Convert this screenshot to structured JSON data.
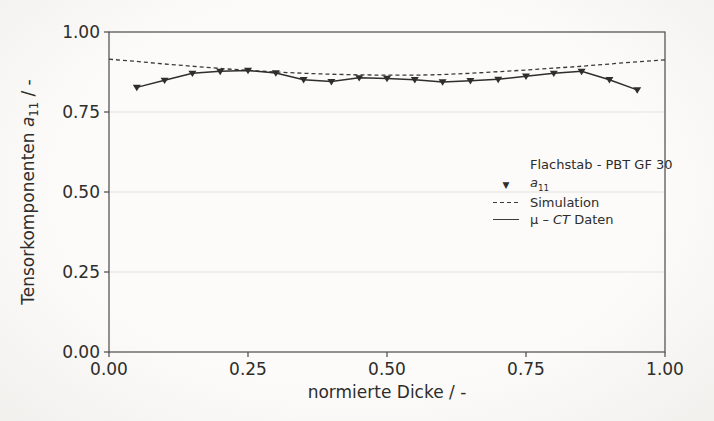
{
  "chart_data": {
    "type": "line",
    "title": "",
    "xlabel": "normierte Dicke / -",
    "ylabel": "Tensorkomponenten a11 / -",
    "ylabel_parts": {
      "prefix": "Tensorkomponenten ",
      "var": "a",
      "sub": "11",
      "suffix": " / -"
    },
    "xlim": [
      0,
      1
    ],
    "ylim": [
      0,
      1
    ],
    "x_ticks": [
      "0.00",
      "0.25",
      "0.50",
      "0.75",
      "1.00"
    ],
    "y_ticks": [
      "1.00",
      "0.75",
      "0.50",
      "0.25",
      "0.00"
    ],
    "grid": "faint horizontal gridlines at interior y ticks",
    "legend_position": "center right, no border",
    "colors": {
      "axis": "#4a4a48",
      "grid": "#eceae7",
      "line": "#2e2e2c",
      "text": "#2d2d2b",
      "background": "#faf9f7"
    },
    "legend": {
      "title": "Flachstab - PBT GF 30",
      "entries": [
        {
          "label": "a11",
          "label_var": "a",
          "label_sub": "11",
          "sample": "triangle-down-marker"
        },
        {
          "label": "Simulation",
          "sample": "dashed-line"
        },
        {
          "label": "μ – CT Daten",
          "label_prefix": "μ – ",
          "label_italic": "CT",
          "label_suffix": " Daten",
          "sample": "solid-line"
        }
      ]
    },
    "series": [
      {
        "name": "Simulation",
        "line": "dashed",
        "dash": "4 3",
        "width": 1.3,
        "color": "#3a3a38",
        "marker": "none",
        "x": [
          0.0,
          0.05,
          0.1,
          0.15,
          0.2,
          0.25,
          0.3,
          0.35,
          0.4,
          0.45,
          0.5,
          0.55,
          0.6,
          0.65,
          0.7,
          0.75,
          0.8,
          0.85,
          0.9,
          0.95,
          1.0
        ],
        "y": [
          0.915,
          0.908,
          0.9,
          0.893,
          0.886,
          0.88,
          0.875,
          0.871,
          0.868,
          0.866,
          0.865,
          0.865,
          0.867,
          0.871,
          0.876,
          0.881,
          0.887,
          0.893,
          0.9,
          0.907,
          0.913
        ]
      },
      {
        "name": "μ – CT Daten (a11)",
        "line": "solid",
        "width": 1.5,
        "color": "#2e2e2c",
        "marker": "triangle-down",
        "x": [
          0.05,
          0.1,
          0.15,
          0.2,
          0.25,
          0.3,
          0.35,
          0.4,
          0.45,
          0.5,
          0.55,
          0.6,
          0.65,
          0.7,
          0.75,
          0.8,
          0.85,
          0.9,
          0.95
        ],
        "y": [
          0.827,
          0.849,
          0.871,
          0.877,
          0.88,
          0.872,
          0.851,
          0.845,
          0.857,
          0.855,
          0.851,
          0.844,
          0.848,
          0.852,
          0.862,
          0.871,
          0.877,
          0.851,
          0.819
        ]
      }
    ]
  }
}
